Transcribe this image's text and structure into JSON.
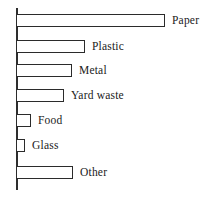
{
  "chart_data": {
    "type": "bar",
    "orientation": "horizontal",
    "title": "",
    "subtitle": "",
    "xlabel": "",
    "ylabel": "",
    "legend": null,
    "legend_position": "none",
    "grid": false,
    "axis": {
      "category_axis": "vertical-left",
      "value_axis_visible": false,
      "tick_labels": [],
      "xlim": [
        0,
        40
      ]
    },
    "categories": [
      "Paper",
      "Plastic",
      "Metal",
      "Yard waste",
      "Food",
      "Glass",
      "Other"
    ],
    "values": [
      35,
      16,
      13,
      11,
      3.5,
      2,
      13
    ],
    "bar_pixel_widths": [
      149,
      69,
      56,
      48,
      15,
      9,
      57
    ],
    "series": [
      {
        "name": "Waste composition",
        "values": [
          35,
          16,
          13,
          11,
          3.5,
          2,
          13
        ]
      }
    ],
    "bars": [
      {
        "label": "Paper",
        "value": 35,
        "pixel_width": 149,
        "top": 14
      },
      {
        "label": "Plastic",
        "value": 16,
        "pixel_width": 69,
        "top": 40
      },
      {
        "label": "Metal",
        "value": 13,
        "pixel_width": 56,
        "top": 64
      },
      {
        "label": "Yard waste",
        "value": 11,
        "pixel_width": 48,
        "top": 89
      },
      {
        "label": "Food",
        "value": 3.5,
        "pixel_width": 15,
        "top": 114
      },
      {
        "label": "Glass",
        "value": 2,
        "pixel_width": 9,
        "top": 139
      },
      {
        "label": "Other",
        "value": 13,
        "pixel_width": 57,
        "top": 166
      }
    ],
    "colors": {
      "bar_fill": "#ffffff",
      "bar_stroke": "#2b2b2b",
      "axis": "#2e2e2e",
      "text": "#1a1a1a",
      "background": "#ffffff"
    }
  }
}
